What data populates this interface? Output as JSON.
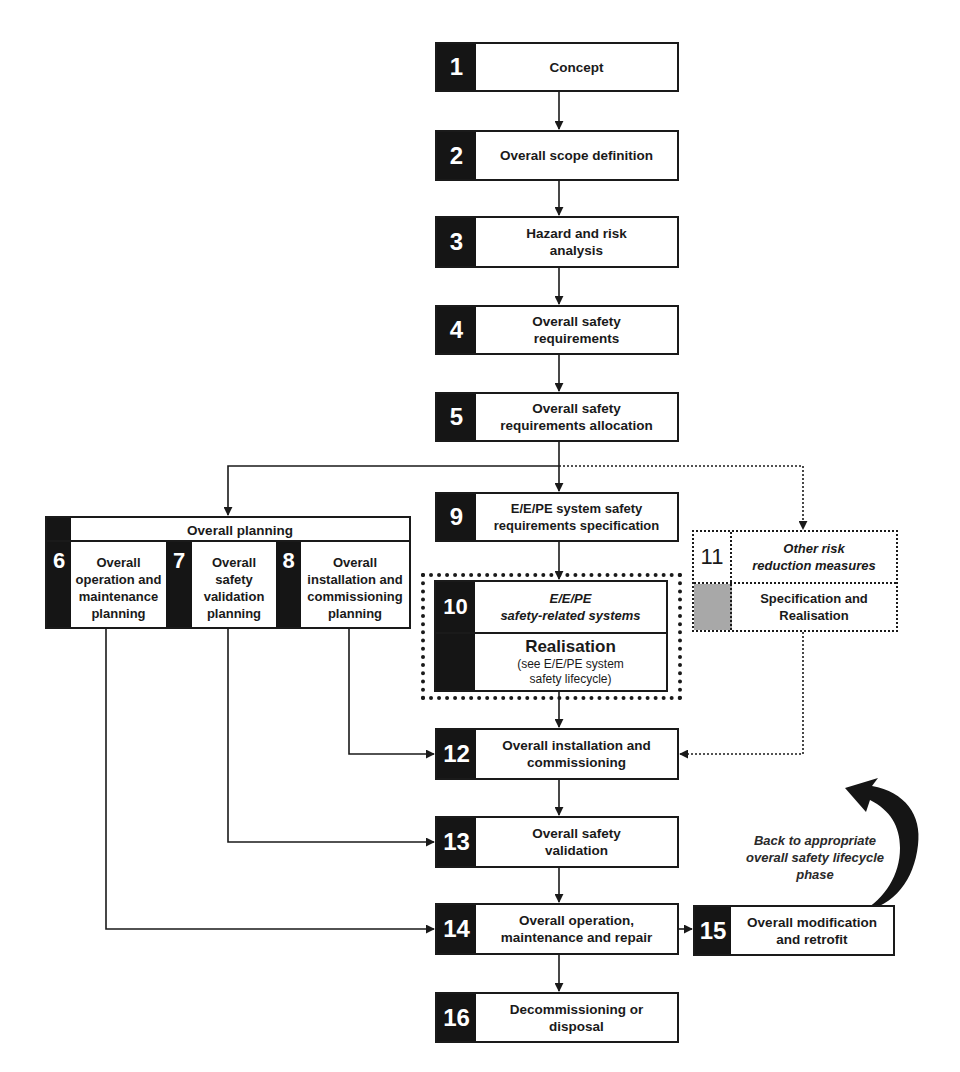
{
  "diagram": {
    "type": "flowchart",
    "subject": "Overall safety lifecycle",
    "colors": {
      "ink": "#1a1a1a",
      "number_cell": "#151515",
      "gray_cell": "#a8a8a8",
      "background": "#ffffff"
    }
  },
  "phases": {
    "p1": {
      "number": "1",
      "lines": [
        "Concept"
      ]
    },
    "p2": {
      "number": "2",
      "lines": [
        "Overall scope definition"
      ]
    },
    "p3": {
      "number": "3",
      "lines": [
        "Hazard and risk",
        "analysis"
      ]
    },
    "p4": {
      "number": "4",
      "lines": [
        "Overall safety",
        "requirements"
      ]
    },
    "p5": {
      "number": "5",
      "lines": [
        "Overall safety",
        "requirements allocation"
      ]
    },
    "planning": {
      "title": "Overall planning"
    },
    "p6": {
      "number": "6",
      "lines": [
        "Overall",
        "operation and",
        "maintenance",
        "planning"
      ]
    },
    "p7": {
      "number": "7",
      "lines": [
        "Overall",
        "safety",
        "validation",
        "planning"
      ]
    },
    "p8": {
      "number": "8",
      "lines": [
        "Overall",
        "installation and",
        "commissioning",
        "planning"
      ]
    },
    "p9": {
      "number": "9",
      "lines": [
        "E/E/PE system safety",
        "requirements specification"
      ]
    },
    "p10": {
      "number": "10",
      "title_lines": [
        "E/E/PE",
        "safety-related systems"
      ],
      "realisation": "Realisation",
      "note_lines": [
        "(see E/E/PE system",
        "safety lifecycle)"
      ]
    },
    "p11": {
      "number": "11",
      "title_lines": [
        "Other risk",
        "reduction measures"
      ],
      "sub_lines": [
        "Specification and",
        "Realisation"
      ]
    },
    "p12": {
      "number": "12",
      "lines": [
        "Overall installation and",
        "commissioning"
      ]
    },
    "p13": {
      "number": "13",
      "lines": [
        "Overall safety",
        "validation"
      ]
    },
    "p14": {
      "number": "14",
      "lines": [
        "Overall operation,",
        "maintenance and repair"
      ]
    },
    "p15": {
      "number": "15",
      "lines": [
        "Overall modification",
        "and retrofit"
      ]
    },
    "p16": {
      "number": "16",
      "lines": [
        "Decommissioning or",
        "disposal"
      ]
    }
  },
  "annotation": {
    "back_lines": [
      "Back to appropriate",
      "overall safety lifecycle",
      "phase"
    ]
  }
}
